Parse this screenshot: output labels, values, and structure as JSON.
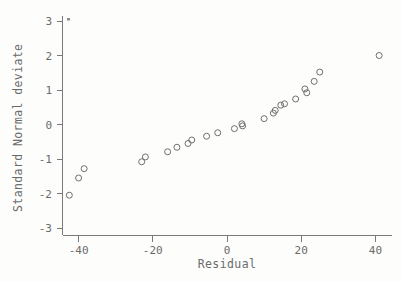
{
  "chart_data": {
    "type": "scatter",
    "title": "",
    "xlabel": "Residual",
    "ylabel": "Standard Normal deviate",
    "xlim": [
      -47,
      47
    ],
    "ylim": [
      -3,
      3.1
    ],
    "xticks": [
      -40,
      -20,
      0,
      20,
      40
    ],
    "xtick_labels": [
      "-40",
      "-20",
      "0",
      "20",
      "40"
    ],
    "yticks": [
      -3,
      -2,
      -1,
      0,
      1,
      2,
      3
    ],
    "ytick_labels": [
      "-3",
      "-2",
      "-1",
      "0",
      "1",
      "2",
      "3"
    ],
    "grid": false,
    "legend": null,
    "marker": "open-circle",
    "marker_color": "#6f6f6f",
    "points": [
      {
        "x": -42.5,
        "y": -2.05
      },
      {
        "x": -40.0,
        "y": -1.55
      },
      {
        "x": -38.5,
        "y": -1.28
      },
      {
        "x": -23.0,
        "y": -1.08
      },
      {
        "x": -22.0,
        "y": -0.94
      },
      {
        "x": -16.0,
        "y": -0.79
      },
      {
        "x": -13.5,
        "y": -0.66
      },
      {
        "x": -10.5,
        "y": -0.55
      },
      {
        "x": -9.5,
        "y": -0.45
      },
      {
        "x": -5.5,
        "y": -0.34
      },
      {
        "x": -2.5,
        "y": -0.24
      },
      {
        "x": 2.0,
        "y": -0.12
      },
      {
        "x": 4.0,
        "y": 0.02
      },
      {
        "x": 4.2,
        "y": -0.04
      },
      {
        "x": 10.0,
        "y": 0.17
      },
      {
        "x": 12.5,
        "y": 0.33
      },
      {
        "x": 13.0,
        "y": 0.41
      },
      {
        "x": 14.5,
        "y": 0.56
      },
      {
        "x": 15.5,
        "y": 0.6
      },
      {
        "x": 18.5,
        "y": 0.74
      },
      {
        "x": 21.0,
        "y": 1.03
      },
      {
        "x": 21.5,
        "y": 0.92
      },
      {
        "x": 23.5,
        "y": 1.25
      },
      {
        "x": 25.0,
        "y": 1.52
      },
      {
        "x": 41.0,
        "y": 2.0
      }
    ]
  },
  "axes": {
    "x_axis_name": "Residual",
    "y_axis_name": "Standard Normal deviate"
  }
}
